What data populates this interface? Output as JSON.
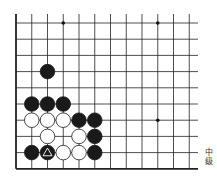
{
  "board": {
    "cols": 12,
    "rows": 10,
    "x0": 16,
    "y0": 23,
    "dx": 15.75,
    "dy": 16.2,
    "line_color": "#222222",
    "edges": [
      "left",
      "bottom"
    ],
    "star_points": [
      [
        3,
        0
      ],
      [
        9,
        0
      ],
      [
        9,
        6
      ]
    ],
    "stones": [
      {
        "c": 2,
        "r": 3,
        "color": "black"
      },
      {
        "c": 1,
        "r": 5,
        "color": "black"
      },
      {
        "c": 2,
        "r": 5,
        "color": "black"
      },
      {
        "c": 3,
        "r": 5,
        "color": "black"
      },
      {
        "c": 1,
        "r": 6,
        "color": "white"
      },
      {
        "c": 2,
        "r": 6,
        "color": "white"
      },
      {
        "c": 3,
        "r": 6,
        "color": "white"
      },
      {
        "c": 4,
        "r": 6,
        "color": "black"
      },
      {
        "c": 5,
        "r": 6,
        "color": "black"
      },
      {
        "c": 2,
        "r": 7,
        "color": "white"
      },
      {
        "c": 4,
        "r": 7,
        "color": "white"
      },
      {
        "c": 5,
        "r": 7,
        "color": "black"
      },
      {
        "c": 1,
        "r": 8,
        "color": "black"
      },
      {
        "c": 2,
        "r": 8,
        "color": "black",
        "marker": "triangle"
      },
      {
        "c": 3,
        "r": 8,
        "color": "white"
      },
      {
        "c": 4,
        "r": 8,
        "color": "white"
      },
      {
        "c": 5,
        "r": 8,
        "color": "black"
      }
    ]
  },
  "caption": {
    "line1": "中",
    "line2": "级"
  }
}
